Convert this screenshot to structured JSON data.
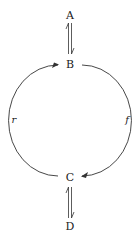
{
  "diagram": {
    "nodes": [
      {
        "id": "A",
        "label": "A",
        "x": 70,
        "y": 15
      },
      {
        "id": "B",
        "label": "B",
        "x": 70,
        "y": 63
      },
      {
        "id": "C",
        "label": "C",
        "x": 70,
        "y": 178
      },
      {
        "id": "D",
        "label": "D",
        "x": 70,
        "y": 226
      }
    ],
    "edges": [
      {
        "from": "A",
        "to": "B",
        "type": "equilibrium",
        "label": ""
      },
      {
        "from": "B",
        "to": "C",
        "type": "arc-right",
        "label": "f"
      },
      {
        "from": "C",
        "to": "B",
        "type": "arc-left",
        "label": "r"
      },
      {
        "from": "C",
        "to": "D",
        "type": "equilibrium",
        "label": ""
      }
    ],
    "edge_labels": {
      "forward": "f",
      "reverse": "r"
    },
    "colors": {
      "line": "#333333",
      "text": "#222222",
      "background": "#ffffff"
    }
  }
}
